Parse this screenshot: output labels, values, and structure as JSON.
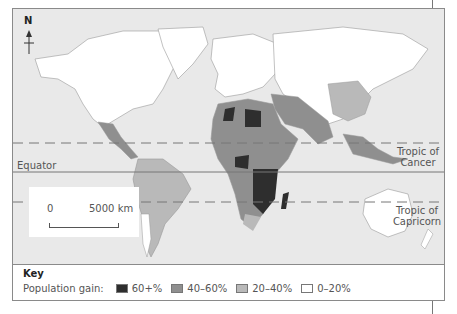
{
  "map": {
    "north_label": "N",
    "lines": {
      "tropic_of_cancer": "Tropic of\nCancer",
      "equator": "Equator",
      "tropic_of_capricorn": "Tropic of\nCapricorn"
    },
    "tropic_of_cancer_line1": "Tropic of",
    "tropic_of_cancer_line2": "Cancer",
    "equator_label": "Equator",
    "tropic_of_capricorn_line1": "Tropic of",
    "tropic_of_capricorn_line2": "Capricorn",
    "scale": {
      "start": "0",
      "end": "5000 km"
    }
  },
  "key": {
    "title": "Key",
    "label": "Population gain:",
    "items": [
      {
        "label": "60+%",
        "color": "#2e2e2e"
      },
      {
        "label": "40–60%",
        "color": "#8f8f8f"
      },
      {
        "label": "20–40%",
        "color": "#b9b9b9"
      },
      {
        "label": "0–20%",
        "color": "#ffffff"
      }
    ]
  },
  "colors": {
    "ocean": "#e9e9e9",
    "land_0_20": "#ffffff",
    "land_20_40": "#b9b9b9",
    "land_40_60": "#8f8f8f",
    "land_60_plus": "#2e2e2e"
  }
}
